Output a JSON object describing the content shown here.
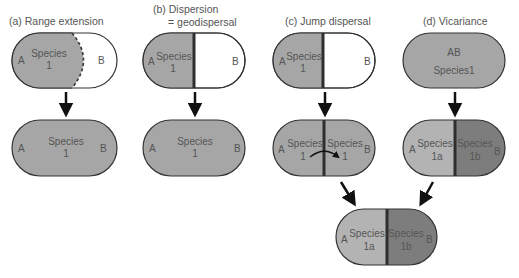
{
  "colors": {
    "species_fill": "#a6a6a6",
    "species_1a_fill": "#b3b3b3",
    "species_1b_fill": "#7d7d7d",
    "empty_fill": "#ffffff",
    "outline": "#333333",
    "barrier": "#2e2e2e",
    "text": "#555555"
  },
  "panels": [
    {
      "id": "a",
      "title": "(a)  Range extension",
      "before": {
        "left_area": "A",
        "right_area": "B",
        "species_line1": "Species",
        "species_line2": "1",
        "boundary": "dashed"
      },
      "after": {
        "left_area": "A",
        "right_area": "B",
        "species_line1": "Species",
        "species_line2": "1"
      }
    },
    {
      "id": "b",
      "title_line1": "(b) Dispersion",
      "title_line2": "= geodispersal",
      "before": {
        "left_area": "A",
        "right_area": "B",
        "species_line1": "Species",
        "species_line2": "1",
        "boundary": "barrier"
      },
      "after": {
        "left_area": "A",
        "right_area": "B",
        "species_line1": "Species",
        "species_line2": "1"
      }
    },
    {
      "id": "c",
      "title": "(c)  Jump dispersal",
      "before": {
        "left_area": "A",
        "right_area": "B",
        "species_line1": "Species",
        "species_line2": "1",
        "boundary": "barrier"
      },
      "after": {
        "left_area": "A",
        "right_area": "B",
        "left_species_line1": "Species",
        "left_species_line2": "1",
        "right_species_line1": "Species",
        "right_species_line2": "1",
        "jump_arrow": true
      }
    },
    {
      "id": "d",
      "title": "(d)  Vicariance",
      "before": {
        "area": "AB",
        "species": "Species1"
      },
      "after": {
        "left_area": "A",
        "right_area": "B",
        "left_species_line1": "Species",
        "left_species_line2": "1a",
        "right_species_line1": "Species",
        "right_species_line2": "1b"
      }
    }
  ],
  "merged_result": {
    "left_area": "A",
    "right_area": "B",
    "left_species_line1": "Species",
    "left_species_line2": "1a",
    "right_species_line1": "Species",
    "right_species_line2": "1b"
  }
}
